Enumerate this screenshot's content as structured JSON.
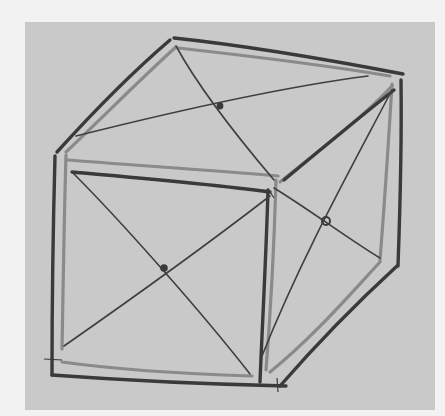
{
  "image": {
    "subject": "hand-drawn cube sketch with face diagonals",
    "colors": {
      "page": "#f2f2f2",
      "paper": "#c9c9c9",
      "ink_dark": "#3a3a3a",
      "ink_light": "#8a8a8a"
    }
  },
  "drawing": {
    "front_face": {
      "corners": [
        [
          72,
          172
        ],
        [
          272,
          190
        ],
        [
          262,
          386
        ],
        [
          50,
          372
        ]
      ],
      "center": [
        164,
        268
      ]
    },
    "top_face": {
      "corners": [
        [
          172,
          40
        ],
        [
          400,
          76
        ],
        [
          272,
          190
        ],
        [
          58,
          152
        ]
      ],
      "center": [
        220,
        106
      ]
    },
    "right_face": {
      "corners": [
        [
          272,
          190
        ],
        [
          400,
          76
        ],
        [
          395,
          265
        ],
        [
          276,
          385
        ]
      ],
      "center": [
        326,
        221
      ]
    }
  }
}
